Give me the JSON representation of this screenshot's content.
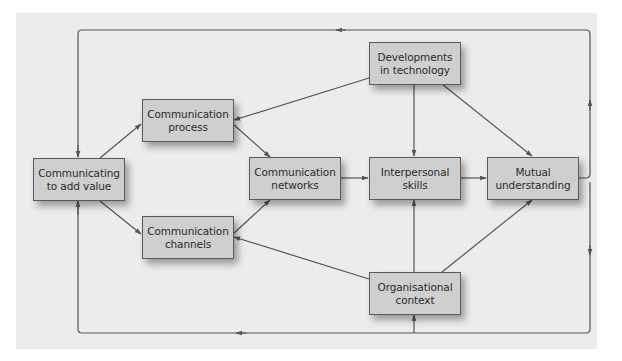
{
  "diagram": {
    "type": "flow",
    "colors": {
      "panel_background": "#ececec",
      "node_fill": "#cfcfcf",
      "node_border": "#5a5a5a",
      "line": "#555555",
      "text": "#2b2b2b"
    },
    "nodes": {
      "communicating_to_add_value": {
        "line1": "Communicating",
        "line2": "to add value"
      },
      "communication_process": {
        "line1": "Communication",
        "line2": "process"
      },
      "communication_channels": {
        "line1": "Communication",
        "line2": "channels"
      },
      "communication_networks": {
        "line1": "Communication",
        "line2": "networks"
      },
      "developments_in_technology": {
        "line1": "Developments",
        "line2": "in technology"
      },
      "interpersonal_skills": {
        "line1": "Interpersonal",
        "line2": "skills"
      },
      "mutual_understanding": {
        "line1": "Mutual",
        "line2": "understanding"
      },
      "organisational_context": {
        "line1": "Organisational",
        "line2": "context"
      }
    },
    "edges": [
      {
        "from": "communicating_to_add_value",
        "to": "communication_process"
      },
      {
        "from": "communicating_to_add_value",
        "to": "communication_channels"
      },
      {
        "from": "communication_process",
        "to": "communication_networks"
      },
      {
        "from": "communication_channels",
        "to": "communication_networks"
      },
      {
        "from": "communication_networks",
        "to": "interpersonal_skills"
      },
      {
        "from": "interpersonal_skills",
        "to": "mutual_understanding"
      },
      {
        "from": "developments_in_technology",
        "to": "communication_process"
      },
      {
        "from": "developments_in_technology",
        "to": "interpersonal_skills"
      },
      {
        "from": "developments_in_technology",
        "to": "mutual_understanding"
      },
      {
        "from": "organisational_context",
        "to": "communication_channels"
      },
      {
        "from": "organisational_context",
        "to": "interpersonal_skills"
      },
      {
        "from": "organisational_context",
        "to": "mutual_understanding"
      },
      {
        "from": "mutual_understanding",
        "to": "communicating_to_add_value",
        "via": "top feedback loop"
      },
      {
        "from": "mutual_understanding",
        "to": "communicating_to_add_value",
        "via": "bottom feedback loop"
      },
      {
        "from": "mutual_understanding",
        "to": "organisational_context",
        "via": "bottom feedback loop"
      }
    ]
  }
}
